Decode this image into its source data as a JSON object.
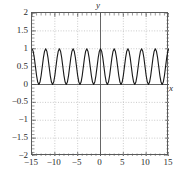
{
  "figure": {
    "background": "#ffffff",
    "frame_color": "#5a5a5a",
    "grid_color": "#bdbdbd",
    "curve_color": "#1a1a1a",
    "axis_color": "#555555"
  },
  "axis_names": {
    "x": "x",
    "y": "y"
  },
  "chart_data": {
    "type": "line",
    "title": "",
    "xlabel": "x",
    "ylabel": "y",
    "xlim": [
      -15,
      15
    ],
    "ylim": [
      -2,
      2
    ],
    "grid": true,
    "legend": "none",
    "xticks": [
      -15,
      -10,
      -5,
      0,
      5,
      10,
      15
    ],
    "xtick_labels": [
      "−15",
      "−10",
      "−5",
      "0",
      "5",
      "10",
      "15"
    ],
    "yticks": [
      -2,
      -1.5,
      -1,
      -0.5,
      0,
      0.5,
      1,
      1.5,
      2
    ],
    "ytick_labels": [
      "−2",
      "−1.5",
      "−1",
      "−0.5",
      "0",
      "0.5",
      "1",
      "1.5",
      "2"
    ],
    "xminor_step": 1,
    "yminor_step": 0.1,
    "series": [
      {
        "name": "y",
        "description": "Oscillating nonnegative wave, amplitude 0 to 1, period 3, maximum at x = 0",
        "period": 3,
        "amplitude": 1,
        "offset": 0,
        "formula": "cos^2(pi*x/3)",
        "x": [
          -15,
          -14.75,
          -14.5,
          -14.25,
          -14,
          -13.75,
          -13.5,
          -13.25,
          -13,
          -12.75,
          -12.5,
          -12.25,
          -12,
          -11.75,
          -11.5,
          -11.25,
          -11,
          -10.75,
          -10.5,
          -10.25,
          -10,
          -9.75,
          -9.5,
          -9.25,
          -9,
          -8.75,
          -8.5,
          -8.25,
          -8,
          -7.75,
          -7.5,
          -7.25,
          -7,
          -6.75,
          -6.5,
          -6.25,
          -6,
          -5.75,
          -5.5,
          -5.25,
          -5,
          -4.75,
          -4.5,
          -4.25,
          -4,
          -3.75,
          -3.5,
          -3.25,
          -3,
          -2.75,
          -2.5,
          -2.25,
          -2,
          -1.75,
          -1.5,
          -1.25,
          -1,
          -0.75,
          -0.5,
          -0.25,
          0,
          0.25,
          0.5,
          0.75,
          1,
          1.25,
          1.5,
          1.75,
          2,
          2.25,
          2.5,
          2.75,
          3,
          3.25,
          3.5,
          3.75,
          4,
          4.25,
          4.5,
          4.75,
          5,
          5.25,
          5.5,
          5.75,
          6,
          6.25,
          6.5,
          6.75,
          7,
          7.25,
          7.5,
          7.75,
          8,
          8.25,
          8.5,
          8.75,
          9,
          9.25,
          9.5,
          9.75,
          10,
          10.25,
          10.5,
          10.75,
          11,
          11.25,
          11.5,
          11.75,
          12,
          12.25,
          12.5,
          12.75,
          13,
          13.25,
          13.5,
          13.75,
          14,
          14.25,
          14.5,
          14.75,
          15
        ],
        "y": [
          1.0,
          0.933,
          0.75,
          0.5,
          0.25,
          0.067,
          0.0,
          0.067,
          0.25,
          0.5,
          0.75,
          0.933,
          1.0,
          0.933,
          0.75,
          0.5,
          0.25,
          0.067,
          0.0,
          0.067,
          0.25,
          0.5,
          0.75,
          0.933,
          1.0,
          0.933,
          0.75,
          0.5,
          0.25,
          0.067,
          0.0,
          0.067,
          0.25,
          0.5,
          0.75,
          0.933,
          1.0,
          0.933,
          0.75,
          0.5,
          0.25,
          0.067,
          0.0,
          0.067,
          0.25,
          0.5,
          0.75,
          0.933,
          1.0,
          0.933,
          0.75,
          0.5,
          0.25,
          0.067,
          0.0,
          0.067,
          0.25,
          0.5,
          0.75,
          0.933,
          1.0,
          0.933,
          0.75,
          0.5,
          0.25,
          0.067,
          0.0,
          0.067,
          0.25,
          0.5,
          0.75,
          0.933,
          1.0,
          0.933,
          0.75,
          0.5,
          0.25,
          0.067,
          0.0,
          0.067,
          0.25,
          0.5,
          0.75,
          0.933,
          1.0,
          0.933,
          0.75,
          0.5,
          0.25,
          0.067,
          0.0,
          0.067,
          0.25,
          0.5,
          0.75,
          0.933,
          1.0,
          0.933,
          0.75,
          0.5,
          0.25,
          0.067,
          0.0,
          0.067,
          0.25,
          0.5,
          0.75,
          0.933,
          1.0,
          0.933,
          0.75,
          0.5,
          0.25,
          0.067,
          0.0,
          0.067,
          0.25,
          0.5,
          0.75,
          0.933,
          1.0
        ]
      }
    ]
  }
}
